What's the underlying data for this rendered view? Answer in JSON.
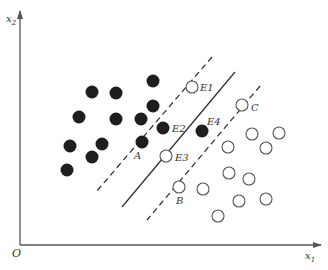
{
  "figure": {
    "colors": {
      "axis": "#555555",
      "line": "#2b2b2b",
      "filled_point": "#1e1e1e",
      "open_point_stroke": "#555555",
      "label": "#333333"
    },
    "axes": {
      "origin_label": "O",
      "x_label": "x",
      "x_sub": "1",
      "y_label": "x",
      "y_sub": "2"
    },
    "point_labels": [
      {
        "id": "A",
        "text": "A"
      },
      {
        "id": "B",
        "text": "B"
      },
      {
        "id": "C",
        "text": "C"
      },
      {
        "id": "E1",
        "text": "E1"
      },
      {
        "id": "E2",
        "text": "E2"
      },
      {
        "id": "E3",
        "text": "E3"
      },
      {
        "id": "E4",
        "text": "E4"
      }
    ],
    "lines": [
      {
        "name": "upper-margin",
        "style": "dashed",
        "from": [
          212,
          57
        ],
        "to": [
          96,
          192
        ]
      },
      {
        "name": "decision-boundary",
        "style": "solid",
        "from": [
          235,
          72
        ],
        "to": [
          122,
          207
        ]
      },
      {
        "name": "lower-margin",
        "style": "dashed",
        "from": [
          260,
          86
        ],
        "to": [
          147,
          220
        ]
      }
    ],
    "filled_points": [
      [
        153,
        81
      ],
      [
        92,
        92
      ],
      [
        116,
        93
      ],
      [
        153,
        106
      ],
      [
        79,
        117
      ],
      [
        116,
        119
      ],
      [
        141,
        119
      ],
      [
        163,
        128
      ],
      [
        70,
        146
      ],
      [
        102,
        144
      ],
      [
        142,
        142
      ],
      [
        92,
        157
      ],
      [
        67,
        170
      ],
      [
        202,
        131
      ]
    ],
    "open_points": [
      [
        192,
        87
      ],
      [
        242,
        105
      ],
      [
        166,
        156
      ],
      [
        179,
        187
      ],
      [
        203,
        189
      ],
      [
        252,
        134
      ],
      [
        279,
        133
      ],
      [
        228,
        147
      ],
      [
        266,
        148
      ],
      [
        229,
        173
      ],
      [
        249,
        179
      ],
      [
        239,
        201
      ],
      [
        266,
        199
      ],
      [
        218,
        216
      ]
    ]
  }
}
